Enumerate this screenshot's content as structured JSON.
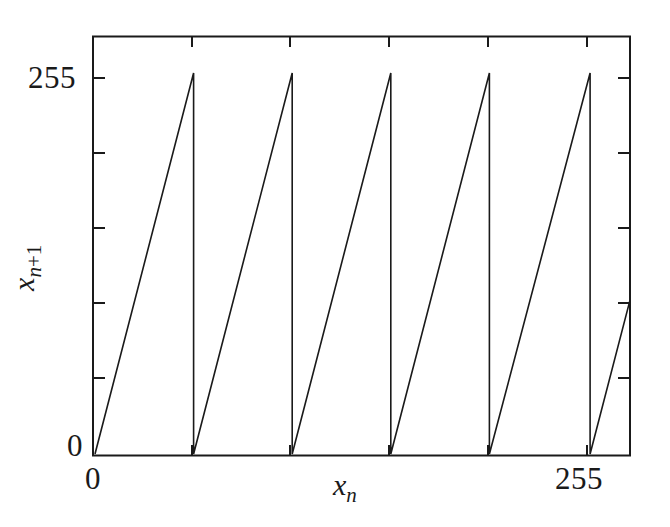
{
  "chart_data": {
    "type": "line",
    "title": "",
    "subtitle": "",
    "xlabel": "x_n",
    "ylabel": "x_n+1",
    "xlabel_base": "x",
    "xlabel_sub": "n",
    "ylabel_base": "x",
    "ylabel_sub": "n+1",
    "xlim": [
      0,
      255
    ],
    "ylim": [
      0,
      255
    ],
    "xticks": [
      0,
      255
    ],
    "xtick_labels": [
      "0",
      "255"
    ],
    "yticks": [
      0,
      255
    ],
    "ytick_labels": [
      "0",
      "255"
    ],
    "grid": false,
    "legend": false,
    "legend_position": "none",
    "line_color": "#1a1a1a",
    "frame_color": "#1a1a1a",
    "background_color": "#ffffff",
    "n_minor_yticks": 5,
    "n_minor_xticks": 5,
    "branches": [
      {
        "x_start": 0,
        "y_start": 0,
        "x_end": 47,
        "y_end": 255
      },
      {
        "x_start": 47,
        "y_start": 0,
        "x_end": 94,
        "y_end": 255
      },
      {
        "x_start": 94,
        "y_start": 0,
        "x_end": 141,
        "y_end": 255
      },
      {
        "x_start": 141,
        "y_start": 0,
        "x_end": 188,
        "y_end": 255
      },
      {
        "x_start": 188,
        "y_start": 0,
        "x_end": 236,
        "y_end": 255
      },
      {
        "x_start": 236,
        "y_start": 0,
        "x_end": 255,
        "y_end": 103
      }
    ],
    "series": [
      {
        "name": "x_{n+1} = 5.4 x_n mod 256",
        "x": [
          0,
          47,
          47,
          94,
          94,
          141,
          141,
          188,
          188,
          236,
          236,
          255
        ],
        "y": [
          0,
          255,
          0,
          255,
          0,
          255,
          0,
          255,
          0,
          255,
          0,
          103
        ]
      }
    ],
    "peaks_x": [
      47,
      94,
      141,
      188,
      236
    ],
    "peaks_y": [
      255,
      255,
      255,
      255,
      255
    ],
    "valleys_x": [
      48,
      95,
      142,
      189,
      237
    ],
    "valleys_y": [
      0,
      0,
      0,
      0,
      0
    ]
  }
}
